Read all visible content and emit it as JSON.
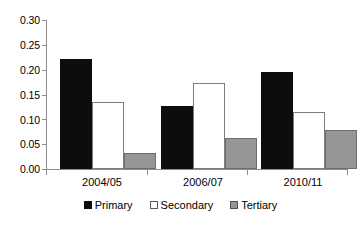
{
  "chart_data": {
    "type": "bar",
    "title": "",
    "subtitle": "",
    "xlabel": "",
    "ylabel": "",
    "categories": [
      "2004/05",
      "2006/07",
      "2010/11"
    ],
    "series": [
      {
        "name": "Primary",
        "color": "#0d0d0d",
        "values": [
          0.221,
          0.126,
          0.196
        ]
      },
      {
        "name": "Secondary",
        "color": "#ffffff",
        "values": [
          0.135,
          0.173,
          0.115
        ]
      },
      {
        "name": "Tertiary",
        "color": "#969696",
        "values": [
          0.033,
          0.063,
          0.078
        ]
      }
    ],
    "ylim": [
      0.0,
      0.3
    ],
    "ytick_values": [
      0.0,
      0.05,
      0.1,
      0.15,
      0.2,
      0.25,
      0.3
    ],
    "ytick_labels": [
      "0.00",
      "0.05",
      "0.10",
      "0.15",
      "0.20",
      "0.25",
      "0.30"
    ],
    "grid": false,
    "legend_position": "bottom",
    "annotations": []
  },
  "legend": {
    "items": [
      {
        "label": "Primary",
        "swatch": "legend-swatch-black"
      },
      {
        "label": "Secondary",
        "swatch": "legend-swatch-white"
      },
      {
        "label": "Tertiary",
        "swatch": "legend-swatch-gray"
      }
    ]
  },
  "axis": {
    "y_labels": [
      "0.30",
      "0.25",
      "0.20",
      "0.15",
      "0.10",
      "0.05",
      "0.00"
    ],
    "x_labels": [
      "2004/05",
      "2006/07",
      "2010/11"
    ]
  },
  "colors": {
    "primary": "#0d0d0d",
    "secondary": "#ffffff",
    "tertiary": "#969696",
    "axis": "#8d8d8d",
    "background": "#ffffff",
    "text": "#000000"
  }
}
